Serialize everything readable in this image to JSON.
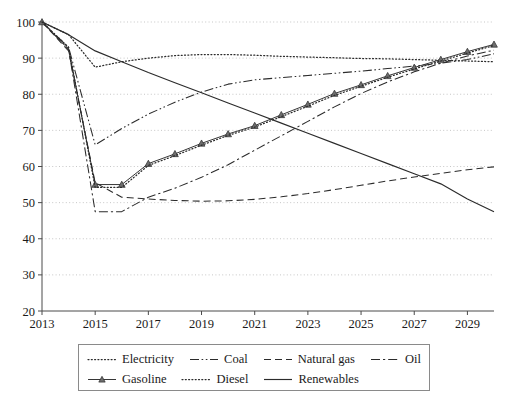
{
  "chart_data": {
    "type": "line",
    "title": "",
    "xlabel": "",
    "ylabel": "",
    "xlim": [
      2013,
      2030
    ],
    "ylim": [
      20,
      100
    ],
    "grid": true,
    "legend_position": "bottom",
    "x": [
      2013,
      2014,
      2015,
      2016,
      2017,
      2018,
      2019,
      2020,
      2021,
      2022,
      2023,
      2024,
      2025,
      2026,
      2027,
      2028,
      2029,
      2030
    ],
    "xticks": [
      "2013",
      "2015",
      "2017",
      "2019",
      "2021",
      "2023",
      "2025",
      "2027",
      "2029"
    ],
    "yticks": [
      "20",
      "30",
      "40",
      "50",
      "60",
      "70",
      "80",
      "90",
      "100"
    ],
    "series": [
      {
        "name": "Electricity",
        "style": "dotted",
        "values": [
          100,
          96.5,
          87.5,
          89.0,
          90.0,
          90.7,
          91.0,
          91.0,
          90.8,
          90.5,
          90.3,
          90.1,
          89.9,
          89.8,
          89.6,
          89.4,
          89.2,
          89.0
        ]
      },
      {
        "name": "Coal",
        "style": "dash-dot-dot",
        "values": [
          100,
          93.0,
          66.0,
          70.5,
          74.5,
          77.8,
          80.6,
          82.8,
          84.0,
          84.6,
          85.2,
          85.8,
          86.4,
          87.1,
          87.8,
          88.6,
          89.6,
          91.2
        ]
      },
      {
        "name": "Natural gas",
        "style": "dashed",
        "values": [
          100,
          92.0,
          55.5,
          51.5,
          51.0,
          50.6,
          50.4,
          50.5,
          50.9,
          51.6,
          52.5,
          53.6,
          54.8,
          56.0,
          57.1,
          58.1,
          59.1,
          59.9
        ]
      },
      {
        "name": "Oil",
        "style": "dash-dot",
        "values": [
          100,
          92.5,
          47.5,
          47.5,
          51.5,
          54.0,
          57.0,
          60.5,
          64.5,
          68.5,
          72.5,
          76.5,
          80.2,
          83.4,
          86.2,
          88.6,
          90.6,
          92.2
        ]
      },
      {
        "name": "Gasoline",
        "style": "solid-marker",
        "markers": true,
        "values": [
          100,
          92.5,
          55.0,
          55.0,
          60.8,
          63.5,
          66.4,
          69.0,
          71.3,
          74.3,
          77.2,
          80.2,
          82.6,
          85.1,
          87.4,
          89.6,
          91.8,
          93.8
        ]
      },
      {
        "name": "Diesel",
        "style": "dotted",
        "values": [
          100,
          93.0,
          54.2,
          54.2,
          60.3,
          63.0,
          65.9,
          68.6,
          70.9,
          73.8,
          76.7,
          79.7,
          82.2,
          84.7,
          87.0,
          89.2,
          91.4,
          93.5
        ]
      },
      {
        "name": "Renewables",
        "style": "solid",
        "values": [
          100,
          96.5,
          92.0,
          89.0,
          86.0,
          83.2,
          80.4,
          77.6,
          74.8,
          72.0,
          69.2,
          66.4,
          63.6,
          60.8,
          58.0,
          55.2,
          51.0,
          47.5
        ]
      }
    ]
  },
  "legend": {
    "rows": [
      [
        {
          "label": "Electricity",
          "style": "dotted"
        },
        {
          "label": "Coal",
          "style": "dash-dot-dot"
        },
        {
          "label": "Natural gas",
          "style": "dashed"
        },
        {
          "label": "Oil",
          "style": "dash-dot"
        }
      ],
      [
        {
          "label": "Gasoline",
          "style": "solid-marker"
        },
        {
          "label": "Diesel",
          "style": "dotted"
        },
        {
          "label": "Renewables",
          "style": "solid"
        }
      ]
    ]
  },
  "colors": {
    "ink": "#2b2b2b",
    "grid": "#b9b9b9",
    "axis": "#4a4a4a",
    "background": "#ffffff",
    "marker_fill": "#6e6e6e"
  }
}
